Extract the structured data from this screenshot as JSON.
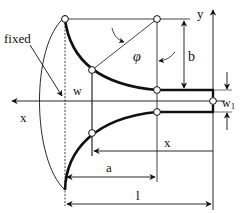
{
  "diagram": {
    "labels": {
      "fixed": "fixed",
      "w": "w",
      "w1": "w",
      "w1_sub": "1",
      "x_axis": "x",
      "y_axis": "y",
      "phi": "φ",
      "b": "b",
      "a": "a",
      "x_dim": "x",
      "l": "l"
    },
    "colors": {
      "stroke": "#111111",
      "background": "#ffffff"
    }
  }
}
